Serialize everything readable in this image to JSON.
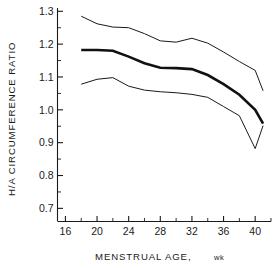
{
  "chart_data": {
    "type": "line",
    "title": "",
    "xlabel": "MENSTRUAL AGE, wk",
    "ylabel": "H/A CIRCUMFERENCE RATIO",
    "xlim": [
      15,
      42
    ],
    "ylim": [
      0.66,
      1.31
    ],
    "grid": false,
    "legend": "none",
    "x_ticks_major": [
      16,
      20,
      24,
      28,
      32,
      36,
      40
    ],
    "x_ticks_minor": [
      18,
      22,
      26,
      30,
      34,
      38,
      42
    ],
    "y_ticks_major": [
      0.7,
      0.8,
      0.9,
      1.0,
      1.1,
      1.2,
      1.3
    ],
    "y_ticks_minor": [
      0.75,
      0.85,
      0.95,
      1.05,
      1.15,
      1.25
    ],
    "x_tick_labels": [
      "16",
      "20",
      "24",
      "28",
      "32",
      "36",
      "40"
    ],
    "y_tick_labels": [
      "0.7",
      "0.8",
      "0.9",
      "1.0",
      "1.1",
      "1.2",
      "1.3"
    ],
    "x": [
      18,
      20,
      22,
      24,
      26,
      28,
      30,
      32,
      34,
      36,
      38,
      40,
      41
    ],
    "series": [
      {
        "name": "upper-percentile",
        "style": "thin",
        "values": [
          1.285,
          1.262,
          1.252,
          1.25,
          1.232,
          1.21,
          1.206,
          1.218,
          1.203,
          1.176,
          1.147,
          1.12,
          1.058
        ]
      },
      {
        "name": "mean",
        "style": "bold",
        "values": [
          1.182,
          1.182,
          1.18,
          1.162,
          1.142,
          1.128,
          1.127,
          1.124,
          1.106,
          1.078,
          1.046,
          1.0,
          0.958
        ]
      },
      {
        "name": "lower-percentile",
        "style": "thin",
        "values": [
          1.078,
          1.093,
          1.098,
          1.072,
          1.06,
          1.055,
          1.052,
          1.047,
          1.038,
          1.01,
          0.982,
          0.882,
          0.952
        ]
      }
    ]
  },
  "figure": {
    "caption_name": "ha-circumference-ratio-chart"
  }
}
